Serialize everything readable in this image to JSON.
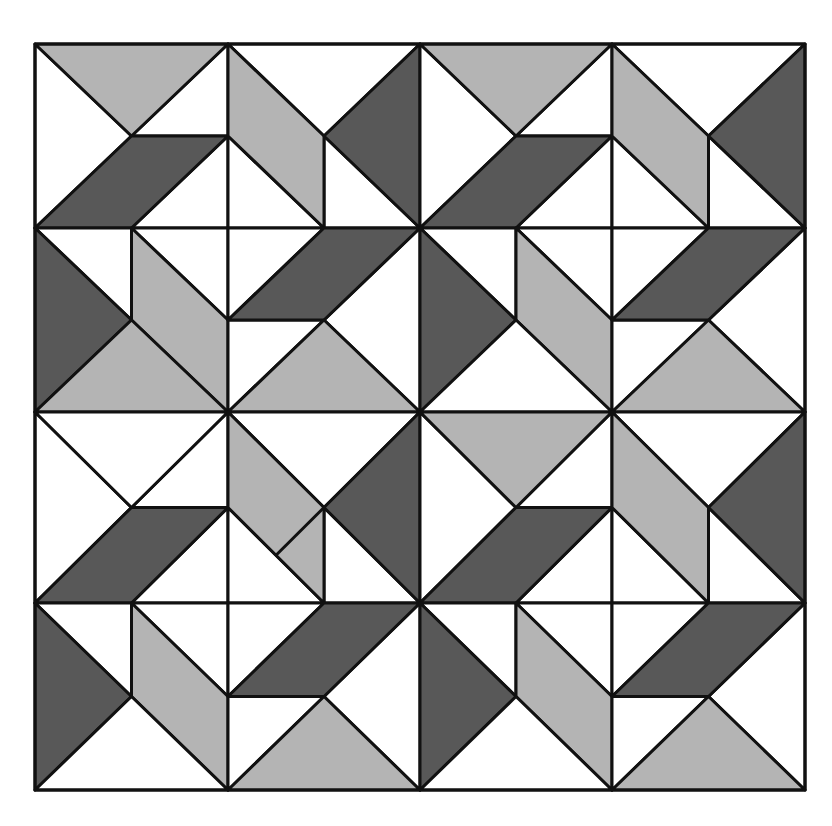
{
  "figure": {
    "type": "tessellation",
    "colors": {
      "dark": "#585858",
      "light": "#b4b4b4",
      "white": "#ffffff",
      "line": "#111111"
    },
    "grid": {
      "cols": 4,
      "rows": 4,
      "x_lines": [
        35,
        228,
        420,
        612,
        805
      ],
      "y_lines": [
        44,
        228,
        412,
        603,
        790
      ]
    },
    "tiles": [
      {
        "row": 0,
        "col": 0,
        "kind": "A",
        "top": "light"
      },
      {
        "row": 0,
        "col": 1,
        "kind": "B"
      },
      {
        "row": 0,
        "col": 2,
        "kind": "A",
        "top": "light"
      },
      {
        "row": 0,
        "col": 3,
        "kind": "B"
      },
      {
        "row": 1,
        "col": 0,
        "kind": "C",
        "bottom": "light"
      },
      {
        "row": 1,
        "col": 1,
        "kind": "D",
        "bottom": "light"
      },
      {
        "row": 1,
        "col": 2,
        "kind": "C",
        "bottom": "white"
      },
      {
        "row": 1,
        "col": 3,
        "kind": "D",
        "bottom": "light"
      },
      {
        "row": 2,
        "col": 0,
        "kind": "A",
        "top": "white"
      },
      {
        "row": 2,
        "col": 1,
        "kind": "B",
        "split": true
      },
      {
        "row": 2,
        "col": 2,
        "kind": "A",
        "top": "light"
      },
      {
        "row": 2,
        "col": 3,
        "kind": "B"
      },
      {
        "row": 3,
        "col": 0,
        "kind": "C",
        "bottom": "white"
      },
      {
        "row": 3,
        "col": 1,
        "kind": "D",
        "bottom": "light"
      },
      {
        "row": 3,
        "col": 2,
        "kind": "C",
        "bottom": "white"
      },
      {
        "row": 3,
        "col": 3,
        "kind": "D",
        "bottom": "light"
      }
    ]
  }
}
